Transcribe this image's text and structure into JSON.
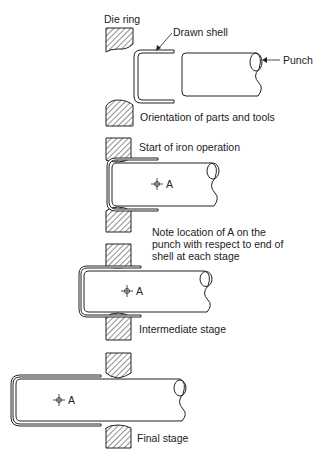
{
  "figure": {
    "stages": [
      {
        "id": "orientation",
        "caption": "Orientation of parts and tools"
      },
      {
        "id": "start",
        "caption": "Start of iron operation"
      },
      {
        "id": "intermediate",
        "caption": "Intermediate stage"
      },
      {
        "id": "final",
        "caption": "Final stage"
      }
    ],
    "labels": {
      "die_ring": "Die ring",
      "drawn_shell": "Drawn shell",
      "punch": "Punch",
      "point_a": "A",
      "note": "Note location of A on the punch with respect to end of shell at each stage"
    },
    "colors": {
      "line": "#222222",
      "background": "#ffffff"
    }
  }
}
